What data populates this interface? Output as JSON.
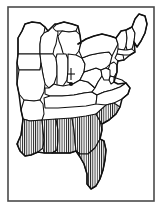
{
  "figure": {
    "width": 163,
    "height": 209,
    "background_color": "#ffffff",
    "line_color": "#111111",
    "frame_color": "#4a4a4a",
    "hatch_color": "#111111"
  },
  "frame": {
    "name": "map-border",
    "x": 8,
    "y": 7,
    "width": 146,
    "height": 194,
    "stroke_width": 1.6
  },
  "legend": {
    "shading_label": "vertical hatch fill",
    "marker_label": "cross marker with dot"
  },
  "marker": {
    "name": "cross-dot-marker",
    "x": 71,
    "y": 74,
    "cross_half_width": 4,
    "cross_top": 68,
    "cross_bottom": 80,
    "dot_x": 71,
    "dot_y": 84,
    "dot_radius": 2.1
  },
  "hatch": {
    "spacing": 2.2,
    "stroke_width": 0.85,
    "angle_degrees": 90
  },
  "regions": [
    {
      "name": "shaded-southeast",
      "shaded": true,
      "states": [
        "Louisiana",
        "Mississippi",
        "Alabama",
        "Georgia",
        "Florida",
        "South Carolina",
        "southern North Carolina"
      ]
    },
    {
      "name": "unshaded-north",
      "shaded": false,
      "states": [
        "Minnesota",
        "Wisconsin",
        "Michigan",
        "Illinois",
        "Indiana",
        "Ohio",
        "Pennsylvania",
        "New York",
        "Vermont",
        "New Hampshire",
        "Maine",
        "Massachusetts",
        "Connecticut",
        "Rhode Island",
        "New Jersey",
        "Delaware",
        "Maryland",
        "West Virginia",
        "Virginia",
        "Kentucky",
        "Tennessee",
        "Missouri",
        "Arkansas",
        "Iowa"
      ]
    }
  ],
  "states": [
    {
      "id": "minnesota",
      "label": "Minnesota",
      "shaded": false,
      "d": "M18,54 L18,38 L22,31 L25,24 L32,22 L40,23 L45,27 L44,33 L41,37 L40,44 L40,54 Z"
    },
    {
      "id": "wisconsin",
      "label": "Wisconsin",
      "shaded": false,
      "d": "M40,54 L40,44 L41,37 L44,33 L48,31 L52,27 L55,24 L57,27 L58,33 L57,38 L56,44 L54,49 L53,54 Z"
    },
    {
      "id": "michigan-upper",
      "label": "Michigan (UP)",
      "shaded": false,
      "d": "M53,28 L57,24 L64,22 L72,24 L78,26 L76,31 L69,32 L62,31 L56,31 Z"
    },
    {
      "id": "michigan-lower",
      "label": "Michigan",
      "shaded": false,
      "d": "M58,36 L62,31 L69,32 L76,31 L80,35 L81,43 L79,51 L74,57 L68,58 L63,53 L61,46 L59,41 Z"
    },
    {
      "id": "iowa",
      "label": "Iowa",
      "shaded": false,
      "d": "M18,54 L40,54 L41,63 L40,70 L19,70 L17,63 Z"
    },
    {
      "id": "illinois",
      "label": "Illinois",
      "shaded": false,
      "d": "M40,54 L53,54 L56,58 L57,66 L57,75 L54,84 L49,88 L45,84 L43,75 L41,63 Z"
    },
    {
      "id": "indiana",
      "label": "Indiana",
      "shaded": false,
      "d": "M57,54 L66,54 L68,59 L68,70 L67,80 L63,86 L57,85 L57,75 L57,66 L56,58 Z"
    },
    {
      "id": "ohio",
      "label": "Ohio",
      "shaded": false,
      "d": "M68,54 L76,55 L82,58 L85,64 L84,72 L80,80 L73,84 L67,82 L68,70 L68,59 Z"
    },
    {
      "id": "missouri",
      "label": "Missouri",
      "shaded": false,
      "d": "M19,70 L40,70 L41,63 L43,75 L45,84 L44,92 L40,100 L34,101 L24,100 L19,94 L17,84 Z"
    },
    {
      "id": "arkansas",
      "label": "Arkansas",
      "shaded": false,
      "d": "M24,100 L34,101 L40,100 L43,104 L44,114 L42,120 L30,121 L23,119 L21,110 Z"
    },
    {
      "id": "kentucky",
      "label": "Kentucky",
      "shaded": false,
      "d": "M45,88 L49,88 L54,84 L57,85 L63,86 L73,84 L80,80 L88,82 L95,88 L92,92 L84,93 L74,95 L62,96 L50,96 L45,94 Z"
    },
    {
      "id": "tennessee",
      "label": "Tennessee",
      "shaded": false,
      "d": "M44,98 L50,96 L62,96 L74,95 L84,93 L92,92 L97,95 L96,104 L86,106 L72,107 L58,108 L45,108 Z"
    },
    {
      "id": "west-virginia",
      "label": "West Virginia",
      "shaded": false,
      "d": "M84,72 L90,70 L96,68 L101,70 L102,76 L98,82 L95,88 L88,82 L80,80 Z"
    },
    {
      "id": "virginia",
      "label": "Virginia",
      "shaded": false,
      "d": "M95,88 L98,82 L102,76 L108,76 L116,78 L122,80 L126,83 L120,87 L112,90 L104,92 L97,95 L92,92 Z"
    },
    {
      "id": "north-carolina",
      "label": "North Carolina",
      "shaded": false,
      "d": "M97,95 L104,92 L112,90 L120,87 L126,83 L130,88 L128,94 L122,99 L114,103 L106,105 L96,104 Z"
    },
    {
      "id": "pennsylvania",
      "label": "Pennsylvania",
      "shaded": false,
      "d": "M82,58 L90,55 L100,53 L109,52 L112,56 L110,64 L106,68 L101,70 L96,68 L90,70 L84,72 L85,64 Z"
    },
    {
      "id": "new-york",
      "label": "New York",
      "shaded": false,
      "d": "M78,44 L86,39 L94,36 L102,34 L110,36 L116,38 L118,44 L115,50 L112,56 L109,52 L100,53 L90,55 L82,58 L79,51 L81,43 Z"
    },
    {
      "id": "vermont",
      "label": "Vermont",
      "shaded": false,
      "d": "M116,38 L121,31 L126,30 L127,38 L126,46 L124,50 L118,49 L118,44 Z"
    },
    {
      "id": "new-hampshire",
      "label": "New Hampshire",
      "shaded": false,
      "d": "M126,30 L132,27 L135,33 L134,42 L132,49 L127,50 L126,46 L127,38 Z"
    },
    {
      "id": "maine",
      "label": "Maine",
      "shaded": false,
      "d": "M132,27 L135,19 L139,14 L145,16 L147,24 L145,33 L141,41 L137,47 L134,42 L135,33 Z"
    },
    {
      "id": "massachusetts",
      "label": "Massachusetts",
      "shaded": false,
      "d": "M118,49 L124,50 L127,50 L132,49 L135,52 L130,55 L123,55 L117,54 Z"
    },
    {
      "id": "connecticut",
      "label": "Connecticut",
      "shaded": false,
      "d": "M117,54 L123,55 L124,60 L118,61 L115,58 Z"
    },
    {
      "id": "new-jersey",
      "label": "New Jersey",
      "shaded": false,
      "d": "M110,64 L114,62 L117,65 L117,72 L114,77 L110,76 L108,70 Z"
    },
    {
      "id": "delaware",
      "label": "Delaware",
      "shaded": false,
      "d": "M110,76 L114,77 L114,82 L111,84 L109,80 Z"
    },
    {
      "id": "maryland",
      "label": "Maryland",
      "shaded": false,
      "d": "M101,70 L106,68 L110,70 L110,76 L109,80 L104,80 L102,76 Z"
    },
    {
      "id": "louisiana",
      "label": "Louisiana",
      "shaded": true,
      "d": "M23,119 L30,121 L42,120 L43,130 L44,140 L43,148 L38,152 L31,155 L25,156 L20,151 L17,144 L21,135 L22,127 Z"
    },
    {
      "id": "mississippi",
      "label": "Mississippi",
      "shaded": true,
      "d": "M42,120 L56,119 L58,130 L58,141 L57,150 L52,153 L44,153 L43,148 L44,140 L43,130 Z"
    },
    {
      "id": "alabama",
      "label": "Alabama",
      "shaded": true,
      "d": "M56,119 L72,118 L74,130 L75,142 L76,151 L70,153 L60,153 L52,153 L57,150 L58,141 L58,130 Z"
    },
    {
      "id": "georgia",
      "label": "Georgia",
      "shaded": true,
      "d": "M72,118 L86,116 L96,114 L100,121 L102,130 L100,139 L95,148 L88,154 L80,154 L76,151 L75,142 L74,130 Z"
    },
    {
      "id": "south-carolina",
      "label": "South Carolina",
      "shaded": true,
      "d": "M96,114 L106,105 L114,103 L120,107 L116,114 L109,120 L102,124 L100,121 Z"
    },
    {
      "id": "florida",
      "label": "Florida",
      "shaded": true,
      "d": "M76,151 L80,154 L88,154 L95,148 L100,139 L104,141 L106,150 L105,160 L103,170 L100,179 L96,186 L91,189 L87,184 L87,174 L84,164 L80,157 Z"
    }
  ],
  "outer_coast": {
    "name": "eastern-us-coastline",
    "d": "M18,54 L18,38 L22,31 L25,24 L32,22 L40,23 L45,27 L48,31 L52,27 L55,24 L57,24 L64,22 L72,24 L78,26 L80,35 L81,43 L78,44 L86,39 L94,36 L102,34 L110,36 L116,38 L121,31 L126,30 L132,27 L135,19 L139,14 L145,16 L147,24 L145,33 L141,41 L137,47 L134,42 L135,52 L130,55 L124,60 L118,61 L117,65 L117,72 L114,82 L118,84 L126,83 L130,88 L128,94 L122,99 L120,107 L116,114 L109,120 L102,124 L102,130 L100,139 L104,141 L106,150 L105,160 L103,170 L100,179 L96,186 L91,189 L87,184 L87,174 L84,164 L80,157 L76,151 L70,153 L60,153 L52,153 L44,153 L38,152 L31,155 L25,156 L20,151 L17,144 L21,135 L22,127 L23,119 L21,110 L19,94 L17,84 L17,63 Z"
  }
}
